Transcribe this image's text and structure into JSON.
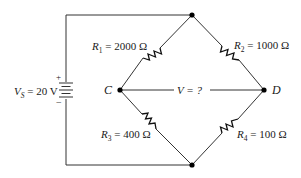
{
  "diagram": {
    "type": "wheatstone-bridge-circuit",
    "source": {
      "label_var": "V",
      "label_sub": "S",
      "label_value": " = 20 V",
      "plus": "+",
      "minus": "−"
    },
    "resistors": [
      {
        "var": "R",
        "sub": "1",
        "value": " = 2000 Ω"
      },
      {
        "var": "R",
        "sub": "2",
        "value": " = 1000 Ω"
      },
      {
        "var": "R",
        "sub": "3",
        "value": " = 400 Ω"
      },
      {
        "var": "R",
        "sub": "4",
        "value": " = 100 Ω"
      }
    ],
    "nodes": {
      "c": "C",
      "d": "D"
    },
    "measurement": {
      "label": "V = ?"
    },
    "colors": {
      "wire": "#333333",
      "node": "#000000",
      "background": "#ffffff"
    }
  }
}
